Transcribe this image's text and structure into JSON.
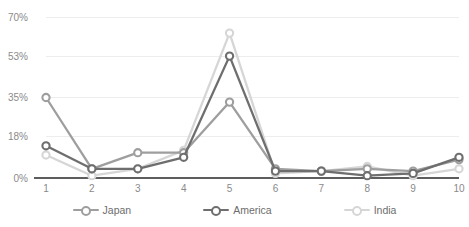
{
  "chart_data": {
    "type": "line",
    "title": "",
    "subtitle": "",
    "xlabel": "",
    "ylabel": "",
    "categories": [
      "1",
      "2",
      "3",
      "4",
      "5",
      "6",
      "7",
      "8",
      "9",
      "10"
    ],
    "x": [
      1,
      2,
      3,
      4,
      5,
      6,
      7,
      8,
      9,
      10
    ],
    "series": [
      {
        "name": "Japan",
        "color": "#9e9e9e",
        "values": [
          35,
          4,
          11,
          11,
          33,
          4,
          3,
          4,
          3,
          8
        ]
      },
      {
        "name": "America",
        "color": "#6e6e6e",
        "values": [
          14,
          4,
          4,
          9,
          53,
          3,
          3,
          1,
          2,
          9
        ]
      },
      {
        "name": "India",
        "color": "#d6d6d6",
        "values": [
          10,
          1,
          4,
          12,
          63,
          2,
          3,
          5,
          1,
          4
        ]
      }
    ],
    "ylim": [
      0,
      70
    ],
    "yticks": [
      0,
      18,
      35,
      53,
      70
    ],
    "ytick_labels": [
      "0%",
      "18%",
      "35%",
      "53%",
      "70%"
    ],
    "xtick_labels": [
      "1",
      "2",
      "3",
      "4",
      "5",
      "6",
      "7",
      "8",
      "9",
      "10"
    ],
    "grid": true,
    "grid_color": "#ededed",
    "axis_color": "#5d5d5d",
    "tick_text_color": "#8a8a8a",
    "legend_position": "bottom",
    "legend_entries": [
      "Japan",
      "America",
      "India"
    ],
    "marker": "circle-open",
    "background": "#ffffff"
  },
  "legend": {
    "items": [
      {
        "label": "Japan",
        "color": "#9e9e9e"
      },
      {
        "label": "America",
        "color": "#6e6e6e"
      },
      {
        "label": "India",
        "color": "#d6d6d6"
      }
    ]
  }
}
